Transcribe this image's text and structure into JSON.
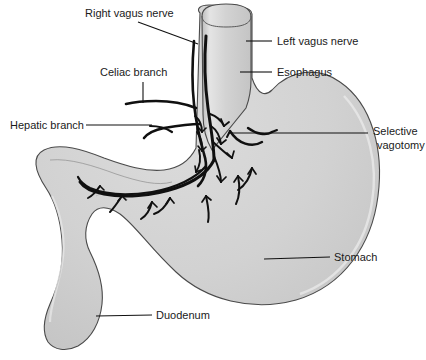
{
  "figure": {
    "type": "anatomical-diagram",
    "background_color": "#ffffff",
    "organ_fill_color": "#d0d0d0",
    "organ_outline_color": "#4a4a4a",
    "nerve_color": "#101010",
    "leader_color": "#111111",
    "text_color": "#1a1a1a"
  },
  "labels": {
    "right_vagus_nerve": "Right vagus nerve",
    "celiac_branch": "Celiac branch",
    "hepatic_branch": "Hepatic branch",
    "left_vagus_nerve": "Left vagus nerve",
    "esophagus": "Esophagus",
    "selective_vagotomy_line1": "Selective",
    "selective_vagotomy_line2": "vagotomy",
    "stomach": "Stomach",
    "duodenum": "Duodenum"
  },
  "structures": [
    {
      "name": "esophagus",
      "label": "Esophagus"
    },
    {
      "name": "stomach",
      "label": "Stomach"
    },
    {
      "name": "duodenum",
      "label": "Duodenum"
    },
    {
      "name": "left-vagus-nerve",
      "label": "Left vagus nerve"
    },
    {
      "name": "right-vagus-nerve",
      "label": "Right vagus nerve"
    },
    {
      "name": "celiac-branch",
      "label": "Celiac branch"
    },
    {
      "name": "hepatic-branch",
      "label": "Hepatic branch"
    },
    {
      "name": "selective-vagotomy",
      "label": "Selective vagotomy"
    }
  ]
}
